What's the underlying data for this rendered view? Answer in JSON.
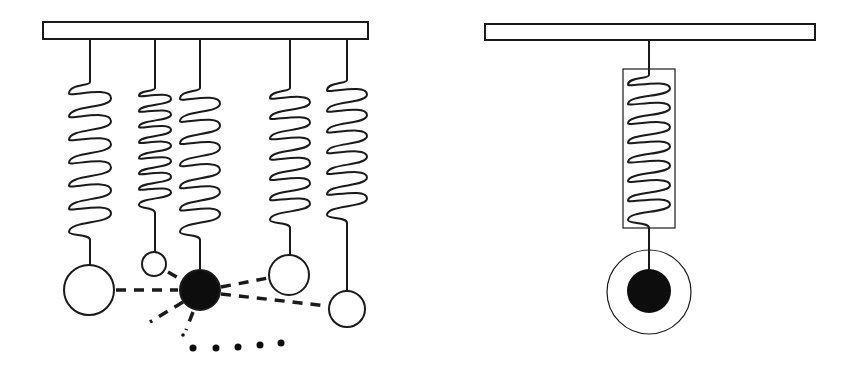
{
  "diagram": {
    "description": "Two spring-mass figures: left shows five springs hanging from a bar with masses interacting (one black central mass linked by dashed lines to others); right shows a single spring enclosed in a box with a black mass inside a ring.",
    "colors": {
      "stroke": "#1a1a1a",
      "fill_dark": "#0d0d0d",
      "background": "#ffffff"
    },
    "left_panel": {
      "bar": {
        "x": 43,
        "y": 22,
        "w": 325,
        "h": 17
      },
      "springs": [
        {
          "id": "s1",
          "x": 90,
          "coil_top": 82,
          "coil_bottom": 232,
          "half_width": 21,
          "loops": 6,
          "mass": {
            "cx": 89,
            "cy": 290,
            "r": 25,
            "filled": false
          }
        },
        {
          "id": "s2",
          "x": 155,
          "coil_top": 88,
          "coil_bottom": 205,
          "half_width": 16,
          "loops": 7,
          "mass": {
            "cx": 154,
            "cy": 264,
            "r": 12,
            "filled": false
          }
        },
        {
          "id": "s3",
          "x": 200,
          "coil_top": 88,
          "coil_bottom": 232,
          "half_width": 20,
          "loops": 6,
          "mass": {
            "cx": 200,
            "cy": 290,
            "r": 20,
            "filled": true
          }
        },
        {
          "id": "s4",
          "x": 290,
          "coil_top": 88,
          "coil_bottom": 220,
          "half_width": 20,
          "loops": 6,
          "mass": {
            "cx": 289,
            "cy": 275,
            "r": 20,
            "filled": false
          }
        },
        {
          "id": "s5",
          "x": 347,
          "coil_top": 80,
          "coil_bottom": 215,
          "half_width": 20,
          "loops": 6,
          "mass": {
            "cx": 347,
            "cy": 309,
            "r": 18,
            "filled": false
          }
        }
      ],
      "dashed_links": [
        {
          "x1": 116,
          "y1": 290,
          "x2": 178,
          "y2": 290
        },
        {
          "x1": 168,
          "y1": 272,
          "x2": 182,
          "y2": 280
        },
        {
          "x1": 221,
          "y1": 287,
          "x2": 268,
          "y2": 278
        },
        {
          "x1": 221,
          "y1": 294,
          "x2": 328,
          "y2": 306
        },
        {
          "x1": 183,
          "y1": 302,
          "x2": 150,
          "y2": 322
        },
        {
          "x1": 193,
          "y1": 312,
          "x2": 186,
          "y2": 330
        }
      ],
      "dots": [
        {
          "cx": 183,
          "cy": 335,
          "r": 1.8
        },
        {
          "cx": 193,
          "cy": 348,
          "r": 3.5
        },
        {
          "cx": 216,
          "cy": 348,
          "r": 3.5
        },
        {
          "cx": 238,
          "cy": 347,
          "r": 3.5
        },
        {
          "cx": 260,
          "cy": 345,
          "r": 3.5
        },
        {
          "cx": 281,
          "cy": 343,
          "r": 3.5
        }
      ]
    },
    "right_panel": {
      "bar": {
        "x": 485,
        "y": 24,
        "w": 330,
        "h": 16
      },
      "spring": {
        "x": 649,
        "coil_top": 75,
        "coil_bottom": 220,
        "half_width": 21,
        "loops": 7
      },
      "enclosure": {
        "x": 623,
        "y": 69,
        "w": 52,
        "h": 159
      },
      "outer_ring": {
        "cx": 649,
        "cy": 292,
        "r": 42
      },
      "inner_mass": {
        "cx": 649,
        "cy": 291,
        "r": 22
      }
    }
  }
}
